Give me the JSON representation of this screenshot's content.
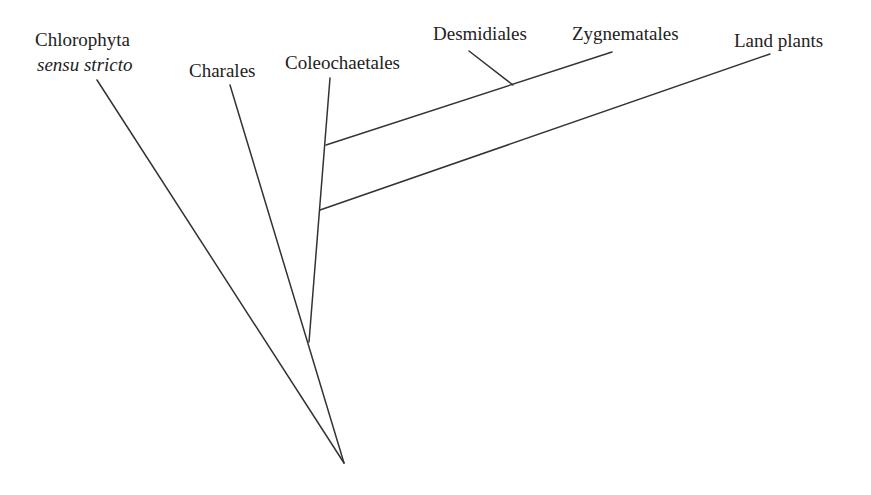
{
  "diagram": {
    "type": "phylogenetic-tree",
    "labels": {
      "chlorophyta": "Chlorophyta",
      "chlorophyta_qualifier": "sensu stricto",
      "charales": "Charales",
      "coleochaetales": "Coleochaetales",
      "desmidiales": "Desmidiales",
      "zygnematales": "Zygnematales",
      "land_plants": "Land plants"
    },
    "line_color": "#333333"
  }
}
